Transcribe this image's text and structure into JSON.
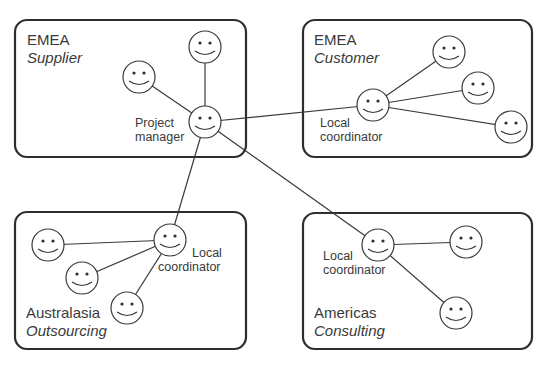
{
  "diagram": {
    "type": "organizational-network",
    "regions": [
      {
        "id": "emea-supplier",
        "name": "EMEA",
        "type": "Supplier",
        "hub_role": [
          "Project",
          "manager"
        ],
        "members": 2
      },
      {
        "id": "emea-customer",
        "name": "EMEA",
        "type": "Customer",
        "hub_role": [
          "Local",
          "coordinator"
        ],
        "members": 3
      },
      {
        "id": "australasia-outsourcing",
        "name": "Australasia",
        "type": "Outsourcing",
        "hub_role": [
          "Local",
          "coordinator"
        ],
        "members": 3
      },
      {
        "id": "americas-consulting",
        "name": "Americas",
        "type": "Consulting",
        "hub_role": [
          "Local",
          "coordinator"
        ],
        "members": 2
      }
    ],
    "connections": [
      {
        "from": "emea-supplier",
        "to": "emea-customer"
      },
      {
        "from": "emea-supplier",
        "to": "australasia-outsourcing"
      },
      {
        "from": "emea-supplier",
        "to": "americas-consulting"
      }
    ],
    "person_icon": "smiley-face-icon"
  }
}
